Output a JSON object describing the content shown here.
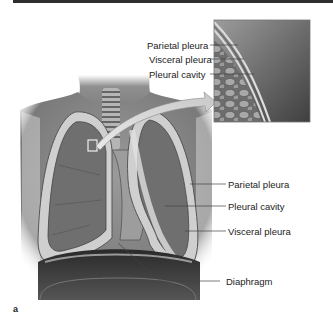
{
  "figure": {
    "panel_letter": "a",
    "inset_labels": [
      "Parietal pleura",
      "Visceral pleura",
      "Pleural cavity"
    ],
    "main_labels": [
      "Parietal pleura",
      "Pleural cavity",
      "Visceral pleura",
      "Diaphragm"
    ]
  },
  "colors": {
    "top_bar": "#2e2e2e",
    "skin": "#8a8a8a",
    "lung": "#6f6f6f",
    "pleura": "#bdbdbd",
    "diaphragm": "#3a3a3a",
    "leader_line": "#444444"
  }
}
